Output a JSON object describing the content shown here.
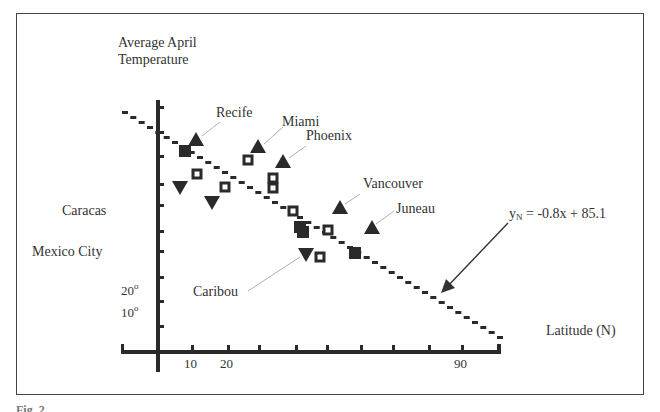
{
  "figure": {
    "y_axis_title_line1": "Average April",
    "y_axis_title_line2": "Temperature",
    "x_axis_title": "Latitude (N)",
    "equation_y": "y",
    "equation_sub": "N",
    "equation_rest": " = -0.8x + 85.1",
    "caption": "Fig. 2."
  },
  "labels": {
    "recife": "Recife",
    "miami": "Miami",
    "phoenix": "Phoenix",
    "vancouver": "Vancouver",
    "juneau": "Juneau",
    "caribou": "Caribou",
    "caracas": "Caracas",
    "mexico_city": "Mexico City"
  },
  "y_tick_labels": {
    "t20": "20",
    "t10": "10",
    "deg": "o"
  },
  "x_tick_labels": {
    "t10": "10",
    "t20": "20",
    "t90": "90"
  },
  "chart_data": {
    "type": "scatter",
    "title": "",
    "xlabel": "Latitude (N)",
    "ylabel": "Average April Temperature",
    "x_ticks_labeled": [
      10,
      20,
      90
    ],
    "y_ticks_labeled": [
      "10°",
      "20°"
    ],
    "grid": false,
    "regression": {
      "label": "y_N = -0.8x + 85.1",
      "slope": -0.8,
      "intercept": 85.1,
      "style": "stepped dashed"
    },
    "annotated_cities": [
      "Recife",
      "Miami",
      "Phoenix",
      "Vancouver",
      "Juneau",
      "Caribou",
      "Caracas",
      "Mexico City"
    ],
    "series": [
      {
        "name": "filled squares",
        "marker": "square-filled",
        "points_px": [
          [
            185,
            151
          ],
          [
            300,
            227
          ],
          [
            303,
            232
          ],
          [
            355,
            253
          ]
        ]
      },
      {
        "name": "open squares",
        "marker": "square-open",
        "points_px": [
          [
            197,
            174
          ],
          [
            225,
            187
          ],
          [
            248,
            160
          ],
          [
            273,
            178
          ],
          [
            273,
            188
          ],
          [
            293,
            211
          ],
          [
            328,
            230
          ],
          [
            320,
            257
          ]
        ]
      },
      {
        "name": "triangles up",
        "marker": "triangle-up",
        "points_px": [
          [
            196,
            140
          ],
          [
            258,
            147
          ],
          [
            283,
            162
          ],
          [
            340,
            208
          ],
          [
            372,
            228
          ]
        ]
      },
      {
        "name": "triangles down",
        "marker": "triangle-down",
        "points_px": [
          [
            180,
            187
          ],
          [
            212,
            202
          ],
          [
            306,
            254
          ]
        ]
      }
    ]
  }
}
